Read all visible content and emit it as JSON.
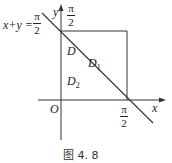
{
  "figure": {
    "line_label_lhs": "x+y =",
    "line_label_frac": {
      "num": "π",
      "den": "2"
    },
    "y_axis_label": "y",
    "x_axis_label": "x",
    "origin_label": "O",
    "top_tick_frac": {
      "num": "π",
      "den": "2"
    },
    "right_tick_frac": {
      "num": "π",
      "den": "2"
    },
    "regions": {
      "D": "D",
      "D1": "D",
      "D1_sub": "1",
      "D2": "D",
      "D2_sub": "2"
    },
    "caption": "图 4. 8"
  },
  "colors": {
    "stroke": "#333333",
    "background": "#ffffff"
  }
}
